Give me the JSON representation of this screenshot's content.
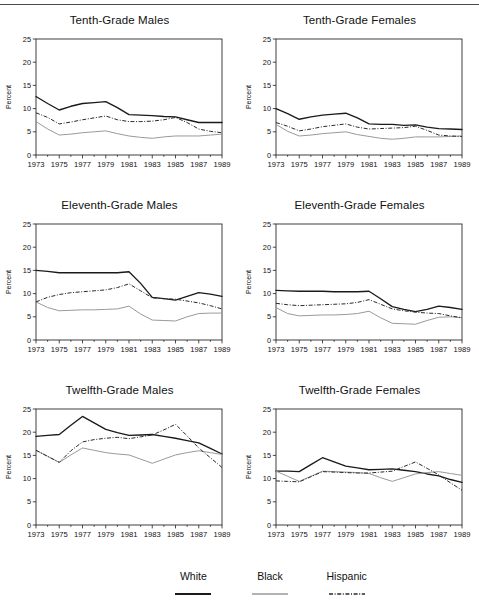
{
  "figure": {
    "panel_order": [
      "tenth_males",
      "tenth_females",
      "eleventh_males",
      "eleventh_females",
      "twelfth_males",
      "twelfth_females"
    ],
    "ylabel": "Percent",
    "legend": {
      "items": [
        {
          "label": "White",
          "style": "solid-bold",
          "color": "#1a1a1a"
        },
        {
          "label": "Black",
          "style": "solid-light",
          "color": "#9a9a9a"
        },
        {
          "label": "Hispanic",
          "style": "dash-dot",
          "color": "#2a2a2a"
        }
      ]
    }
  },
  "chart_data": [
    {
      "type": "line",
      "title": "Tenth-Grade Males",
      "xlabel": "",
      "ylabel": "Percent",
      "x": [
        1973,
        1974,
        1975,
        1976,
        1977,
        1978,
        1979,
        1980,
        1981,
        1982,
        1983,
        1984,
        1985,
        1986,
        1987,
        1988,
        1989
      ],
      "xticks": [
        1973,
        1975,
        1977,
        1979,
        1981,
        1983,
        1985,
        1987,
        1989
      ],
      "yticks": [
        0,
        5,
        10,
        15,
        20,
        25
      ],
      "xlim": [
        1973,
        1989
      ],
      "ylim": [
        0,
        25
      ],
      "grid": false,
      "legend_position": "below-figure",
      "series": [
        {
          "name": "White",
          "values": [
            12.6,
            11.1,
            9.7,
            10.5,
            11.1,
            11.3,
            11.5,
            10.2,
            8.7,
            8.6,
            8.5,
            8.3,
            8.2,
            7.6,
            7.0,
            7.0,
            7.0
          ]
        },
        {
          "name": "Black",
          "values": [
            7.2,
            5.6,
            4.3,
            4.5,
            4.8,
            5.0,
            5.2,
            4.6,
            4.1,
            3.8,
            3.6,
            3.9,
            4.1,
            4.1,
            4.1,
            4.3,
            4.5
          ]
        },
        {
          "name": "Hispanic",
          "values": [
            9.1,
            8.1,
            6.7,
            7.1,
            7.6,
            8.0,
            8.4,
            7.6,
            7.2,
            7.2,
            7.3,
            7.6,
            8.1,
            7.0,
            5.6,
            5.1,
            4.8
          ]
        }
      ]
    },
    {
      "type": "line",
      "title": "Tenth-Grade Females",
      "xlabel": "",
      "ylabel": "Percent",
      "x": [
        1973,
        1974,
        1975,
        1976,
        1977,
        1978,
        1979,
        1980,
        1981,
        1982,
        1983,
        1984,
        1985,
        1986,
        1987,
        1988,
        1989
      ],
      "xticks": [
        1973,
        1975,
        1977,
        1979,
        1981,
        1983,
        1985,
        1987,
        1989
      ],
      "yticks": [
        0,
        5,
        10,
        15,
        20,
        25
      ],
      "xlim": [
        1973,
        1989
      ],
      "ylim": [
        0,
        25
      ],
      "grid": false,
      "legend_position": "below-figure",
      "series": [
        {
          "name": "White",
          "values": [
            10.0,
            8.9,
            7.7,
            8.2,
            8.6,
            8.8,
            9.0,
            8.0,
            6.7,
            6.6,
            6.6,
            6.4,
            6.5,
            6.0,
            5.7,
            5.6,
            5.5
          ]
        },
        {
          "name": "Black",
          "values": [
            6.6,
            5.1,
            4.1,
            4.3,
            4.6,
            4.8,
            5.0,
            4.4,
            4.0,
            3.6,
            3.4,
            3.6,
            3.9,
            3.9,
            3.9,
            4.0,
            4.1
          ]
        },
        {
          "name": "Hispanic",
          "values": [
            7.0,
            6.2,
            5.2,
            5.6,
            6.1,
            6.4,
            6.7,
            6.0,
            5.6,
            5.7,
            5.8,
            5.9,
            6.2,
            5.3,
            4.3,
            4.1,
            4.0
          ]
        }
      ]
    },
    {
      "type": "line",
      "title": "Eleventh-Grade Males",
      "xlabel": "",
      "ylabel": "Percent",
      "x": [
        1973,
        1974,
        1975,
        1976,
        1977,
        1978,
        1979,
        1980,
        1981,
        1982,
        1983,
        1984,
        1985,
        1986,
        1987,
        1988,
        1989
      ],
      "xticks": [
        1973,
        1975,
        1977,
        1979,
        1981,
        1983,
        1985,
        1987,
        1989
      ],
      "yticks": [
        0,
        5,
        10,
        15,
        20,
        25
      ],
      "xlim": [
        1973,
        1989
      ],
      "ylim": [
        0,
        25
      ],
      "grid": false,
      "legend_position": "below-figure",
      "series": [
        {
          "name": "White",
          "values": [
            15.0,
            14.8,
            14.5,
            14.5,
            14.5,
            14.5,
            14.5,
            14.5,
            14.7,
            12.2,
            9.2,
            8.9,
            8.6,
            9.4,
            10.2,
            9.9,
            9.4
          ]
        },
        {
          "name": "Black",
          "values": [
            8.2,
            7.0,
            6.3,
            6.4,
            6.5,
            6.5,
            6.6,
            6.7,
            7.3,
            5.6,
            4.3,
            4.2,
            4.1,
            5.0,
            5.7,
            5.8,
            5.8
          ]
        },
        {
          "name": "Hispanic",
          "values": [
            8.2,
            9.2,
            9.8,
            10.2,
            10.4,
            10.6,
            10.8,
            11.3,
            12.1,
            10.6,
            9.1,
            8.9,
            8.8,
            8.4,
            8.0,
            7.4,
            6.7
          ]
        }
      ]
    },
    {
      "type": "line",
      "title": "Eleventh-Grade Females",
      "xlabel": "",
      "ylabel": "Percent",
      "x": [
        1973,
        1974,
        1975,
        1976,
        1977,
        1978,
        1979,
        1980,
        1981,
        1982,
        1983,
        1984,
        1985,
        1986,
        1987,
        1988,
        1989
      ],
      "xticks": [
        1973,
        1975,
        1977,
        1979,
        1981,
        1983,
        1985,
        1987,
        1989
      ],
      "yticks": [
        0,
        5,
        10,
        15,
        20,
        25
      ],
      "xlim": [
        1973,
        1989
      ],
      "ylim": [
        0,
        25
      ],
      "grid": false,
      "legend_position": "below-figure",
      "series": [
        {
          "name": "White",
          "values": [
            10.7,
            10.6,
            10.5,
            10.5,
            10.5,
            10.4,
            10.4,
            10.4,
            10.5,
            8.9,
            7.2,
            6.6,
            6.1,
            6.6,
            7.3,
            7.0,
            6.6
          ]
        },
        {
          "name": "Black",
          "values": [
            7.0,
            5.7,
            5.2,
            5.3,
            5.4,
            5.4,
            5.5,
            5.7,
            6.2,
            4.8,
            3.6,
            3.5,
            3.4,
            4.2,
            4.9,
            5.0,
            4.8
          ]
        },
        {
          "name": "Hispanic",
          "values": [
            7.9,
            7.6,
            7.4,
            7.5,
            7.6,
            7.7,
            7.8,
            8.1,
            8.7,
            7.7,
            6.7,
            6.3,
            6.0,
            5.8,
            5.7,
            5.2,
            4.8
          ]
        }
      ]
    },
    {
      "type": "line",
      "title": "Twelfth-Grade Males",
      "xlabel": "",
      "ylabel": "Percent",
      "x": [
        1973,
        1974,
        1975,
        1976,
        1977,
        1978,
        1979,
        1980,
        1981,
        1982,
        1983,
        1984,
        1985,
        1986,
        1987,
        1988,
        1989
      ],
      "xticks": [
        1973,
        1975,
        1977,
        1979,
        1981,
        1983,
        1985,
        1987,
        1989
      ],
      "yticks": [
        0,
        5,
        10,
        15,
        20,
        25
      ],
      "xlim": [
        1973,
        1989
      ],
      "ylim": [
        0,
        25
      ],
      "grid": false,
      "legend_position": "below-figure",
      "series": [
        {
          "name": "White",
          "values": [
            19.1,
            19.3,
            19.5,
            21.5,
            23.4,
            22.0,
            20.6,
            19.9,
            19.3,
            19.4,
            19.5,
            19.1,
            18.7,
            18.2,
            17.7,
            16.5,
            15.3
          ]
        },
        {
          "name": "Black",
          "values": [
            16.1,
            14.8,
            13.5,
            15.1,
            16.6,
            16.1,
            15.6,
            15.3,
            15.1,
            14.2,
            13.3,
            14.2,
            15.1,
            15.6,
            16.0,
            15.6,
            15.2
          ]
        },
        {
          "name": "Hispanic",
          "values": [
            16.1,
            14.8,
            13.5,
            16.0,
            17.9,
            18.4,
            18.7,
            18.9,
            18.6,
            19.0,
            19.4,
            20.5,
            21.7,
            19.2,
            16.6,
            14.5,
            12.4
          ]
        }
      ]
    },
    {
      "type": "line",
      "title": "Twelfth-Grade Females",
      "xlabel": "",
      "ylabel": "Percent",
      "x": [
        1973,
        1974,
        1975,
        1976,
        1977,
        1978,
        1979,
        1980,
        1981,
        1982,
        1983,
        1984,
        1985,
        1986,
        1987,
        1988,
        1989
      ],
      "xticks": [
        1973,
        1975,
        1977,
        1979,
        1981,
        1983,
        1985,
        1987,
        1989
      ],
      "yticks": [
        0,
        5,
        10,
        15,
        20,
        25
      ],
      "xlim": [
        1973,
        1989
      ],
      "ylim": [
        0,
        25
      ],
      "grid": false,
      "legend_position": "below-figure",
      "series": [
        {
          "name": "White",
          "values": [
            11.6,
            11.6,
            11.5,
            13.0,
            14.5,
            13.6,
            12.7,
            12.3,
            11.9,
            12.0,
            12.1,
            11.8,
            11.5,
            11.0,
            10.6,
            9.8,
            9.2
          ]
        },
        {
          "name": "Black",
          "values": [
            11.6,
            10.5,
            9.4,
            10.5,
            11.6,
            11.5,
            11.4,
            11.3,
            11.1,
            10.2,
            9.4,
            10.2,
            11.0,
            11.3,
            11.5,
            11.1,
            10.7
          ]
        },
        {
          "name": "Hispanic",
          "values": [
            9.5,
            9.4,
            9.3,
            10.4,
            11.5,
            11.4,
            11.3,
            11.2,
            11.2,
            11.4,
            11.6,
            12.6,
            13.6,
            12.2,
            10.8,
            9.1,
            7.5
          ]
        }
      ]
    }
  ]
}
